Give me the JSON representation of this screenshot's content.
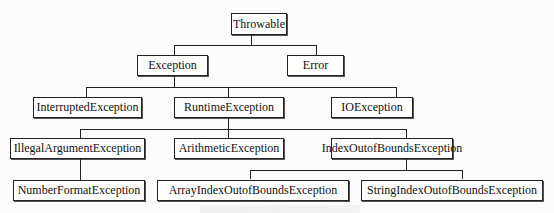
{
  "diagram": {
    "type": "class-hierarchy-tree",
    "nodes": [
      {
        "id": "throwable",
        "label": "Throwable",
        "parent": null
      },
      {
        "id": "exception",
        "label": "Exception",
        "parent": "throwable"
      },
      {
        "id": "error",
        "label": "Error",
        "parent": "throwable"
      },
      {
        "id": "interrupted",
        "label": "InterruptedException",
        "parent": "exception"
      },
      {
        "id": "runtime",
        "label": "RuntimeException",
        "parent": "exception"
      },
      {
        "id": "io",
        "label": "IOException",
        "parent": "exception"
      },
      {
        "id": "illegalarg",
        "label": "IllegalArgumentException",
        "parent": "runtime"
      },
      {
        "id": "arithmetic",
        "label": "ArithmeticException",
        "parent": "runtime"
      },
      {
        "id": "indexoob",
        "label": "IndexOutofBoundsException",
        "parent": "runtime"
      },
      {
        "id": "numberformat",
        "label": "NumberFormatException",
        "parent": "illegalarg"
      },
      {
        "id": "arrayindexoob",
        "label": "ArrayIndexOutofBoundsException",
        "parent": "indexoob"
      },
      {
        "id": "stringindexoob",
        "label": "StringIndexOutofBoundsException",
        "parent": "indexoob"
      }
    ]
  }
}
